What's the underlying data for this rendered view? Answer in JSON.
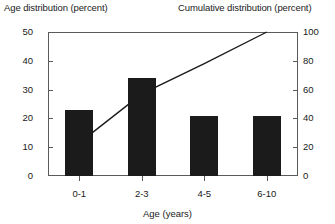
{
  "header": {
    "left_title": "Age distribution (percent)",
    "right_title": "Cumulative distribution (percent)"
  },
  "chart_data": {
    "type": "bar",
    "title": "",
    "subtitle": "",
    "xlabel": "Age (years)",
    "ylabel": "Age distribution (percent)",
    "y2label": "Cumulative distribution (percent)",
    "categories": [
      "0-1",
      "2-3",
      "4-5",
      "6-10"
    ],
    "values": [
      23,
      34,
      21,
      21
    ],
    "ylim": [
      0,
      50
    ],
    "yticks": [
      0,
      10,
      20,
      30,
      40,
      50
    ],
    "ytick_labels": [
      "0",
      "10",
      "20",
      "30",
      "40",
      "50"
    ],
    "y2lim": [
      0,
      100
    ],
    "y2ticks": [
      0,
      20,
      40,
      60,
      80,
      100
    ],
    "y2tick_labels": [
      "0",
      "20",
      "40",
      "60",
      "80",
      "100"
    ],
    "grid": false,
    "legend": false,
    "series": [
      {
        "name": "Age distribution (percent)",
        "type": "bar",
        "axis": "left",
        "values": [
          23,
          34,
          21,
          21
        ]
      },
      {
        "name": "Cumulative distribution (percent)",
        "type": "line",
        "axis": "right",
        "values": [
          23,
          57,
          78,
          100
        ]
      }
    ],
    "bar_color": "#1b1b1b",
    "line_color": "#1b1b1b",
    "axis_color": "#5a5a5a"
  }
}
